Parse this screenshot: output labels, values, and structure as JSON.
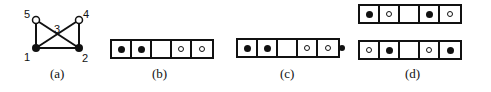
{
  "panels": {
    "a": {
      "label": "(a)",
      "graph": {
        "nodes": [
          {
            "id": "1",
            "type": "filled"
          },
          {
            "id": "2",
            "type": "filled"
          },
          {
            "id": "3",
            "type": "crossing"
          },
          {
            "id": "4",
            "type": "open"
          },
          {
            "id": "5",
            "type": "open"
          }
        ],
        "edges": [
          [
            "1",
            "2"
          ],
          [
            "1",
            "5"
          ],
          [
            "2",
            "4"
          ],
          [
            "1",
            "4"
          ],
          [
            "2",
            "5"
          ]
        ]
      }
    },
    "b": {
      "label": "(b)",
      "cells": [
        "filled",
        "filled",
        "empty",
        "open",
        "open"
      ]
    },
    "c": {
      "label": "(c)",
      "cells": [
        "filled",
        "filled",
        "empty",
        "open",
        "open"
      ],
      "outside": "filled"
    },
    "d": {
      "label": "(d)",
      "rows": [
        [
          "filled",
          "open",
          "empty",
          "filled",
          "open"
        ],
        [
          "open",
          "filled",
          "empty",
          "open",
          "filled"
        ]
      ]
    }
  },
  "colors": {
    "ink": "#111111",
    "background": "#ffffff"
  }
}
